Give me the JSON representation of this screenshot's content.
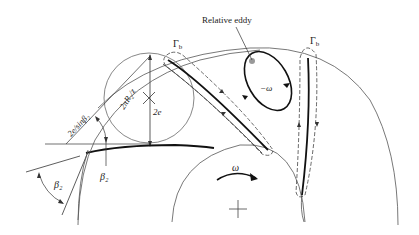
{
  "diagram": {
    "type": "centrifugal impeller slip / relative eddy schematic",
    "labels": {
      "relative_eddy": "Relative eddy",
      "gamma_b_left": "Γ",
      "gamma_b_left_sub": "b",
      "gamma_b_right": "Γ",
      "gamma_b_right_sub": "b",
      "minus_omega": "−ω",
      "omega": "ω",
      "two_pi_r2_over_z": "2πR₂/z",
      "two_e": "2e",
      "two_e_over_sin_beta2": "2e/sinβ₂",
      "beta2_inner": "β₂",
      "beta2_outer": "β₂"
    },
    "colors": {
      "line": "#333333",
      "circle": "#777777",
      "eddy_marker": "#999999"
    }
  }
}
